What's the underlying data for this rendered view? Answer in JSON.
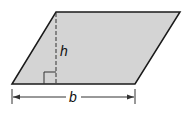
{
  "diagram": {
    "shape": "parallelogram",
    "fill_color": "#d4d4d4",
    "stroke_color": "#1a1a1a",
    "labels": {
      "height": "h",
      "base": "b"
    }
  }
}
